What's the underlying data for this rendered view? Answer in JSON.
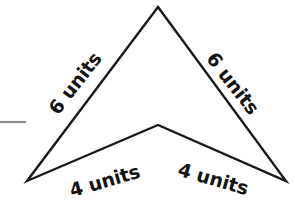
{
  "figure": {
    "name": "arrowhead-quadrilateral",
    "background_color": "#ffffff",
    "stroke_color": "#1a1a1a",
    "stroke_width": 2.4,
    "vertices": {
      "apex": {
        "x": 158,
        "y": 7
      },
      "right": {
        "x": 286,
        "y": 181
      },
      "notch": {
        "x": 158,
        "y": 125
      },
      "left": {
        "x": 27,
        "y": 181
      }
    },
    "path": "M 158 7 L 286 181 L 158 125 L 27 181 Z"
  },
  "labels": {
    "upper_left": {
      "text": "6 units",
      "x": 76,
      "y": 84,
      "rotation": -52
    },
    "upper_right": {
      "text": "6 units",
      "x": 232,
      "y": 84,
      "rotation": 52
    },
    "lower_left": {
      "text": "4 units",
      "x": 105,
      "y": 182,
      "rotation": -16
    },
    "lower_right": {
      "text": "4 units",
      "x": 213,
      "y": 180,
      "rotation": 16
    }
  },
  "margin_rule": {
    "name": "margin-rule-line",
    "color": "#8a8a8a",
    "x1": 0,
    "y1": 122,
    "x2": 26,
    "y2": 122
  }
}
